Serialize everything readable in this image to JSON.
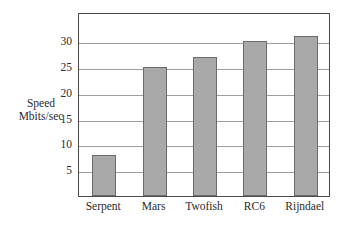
{
  "chart_data": {
    "type": "bar",
    "title": "",
    "xlabel": "",
    "ylabel": "Speed Mbits/sec",
    "ylabel_lines": [
      "Speed",
      "Mbits/sec"
    ],
    "categories": [
      "Serpent",
      "Mars",
      "Twofish",
      "RC6",
      "Rijndael"
    ],
    "values": [
      8,
      25,
      27,
      30,
      31
    ],
    "ylim": [
      0,
      35.7
    ],
    "yticks": [
      5,
      10,
      15,
      20,
      25,
      30
    ],
    "ytick_labels": [
      "5",
      "10",
      "15",
      "20",
      "25",
      "30"
    ],
    "grid": true,
    "grid_axis": "y",
    "legend": null,
    "bar_color": "#a9a9a9",
    "bar_edge_color": "#6b6b6b",
    "grid_color": "#9e9e9e",
    "frame_color": "#4a4a4a",
    "background_color": "#ffffff",
    "text_color": "#2b2b2b"
  }
}
